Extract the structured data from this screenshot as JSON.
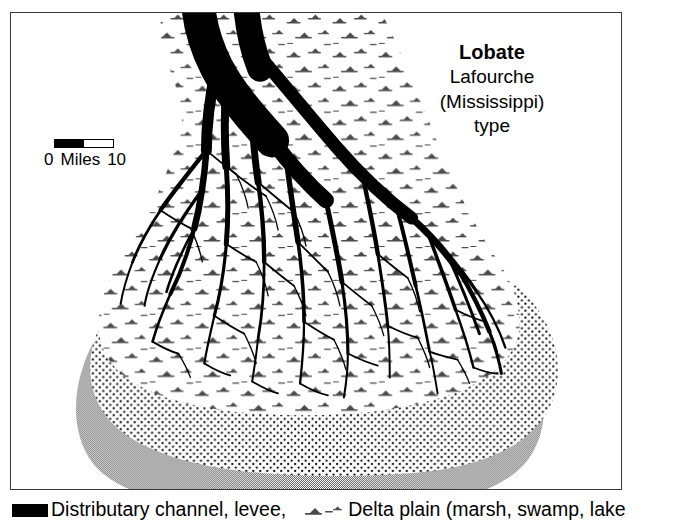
{
  "figure": {
    "kind": "delta-morphology-map",
    "background_color": "#ffffff"
  },
  "map": {
    "frame_color": "#3a3a3a",
    "title": {
      "heading": "Lobate",
      "line2": "Lafourche",
      "line3": "(Mississippi)",
      "line4": "type"
    },
    "scale": {
      "min_label": "0",
      "unit_label": "Miles",
      "max_label": "10"
    },
    "colors": {
      "channel": "#000000",
      "delta_plain": "#ffffff",
      "stipple_band": "#000000",
      "sea": "#909090",
      "marsh_symbol": "#3a3a3a"
    }
  },
  "legend": {
    "items": [
      {
        "id": "channel",
        "swatch": "solid-black-bar",
        "label": "Distributary channel, levee,"
      },
      {
        "id": "delta-plain",
        "swatch": "marsh-symbol",
        "label": "Delta plain (marsh, swamp, lake"
      }
    ]
  }
}
